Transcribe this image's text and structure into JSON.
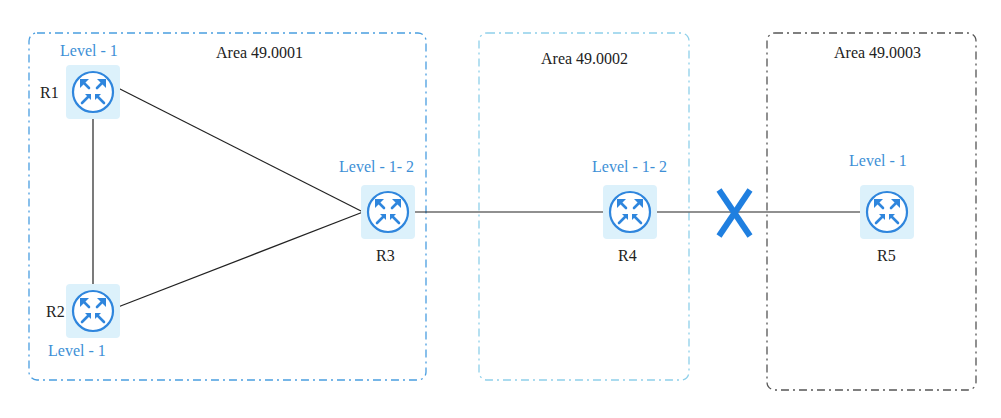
{
  "areas": [
    {
      "id": "area1",
      "label": "Area 49.0001",
      "color": "#4a9ee0"
    },
    {
      "id": "area2",
      "label": "Area 49.0002",
      "color": "#8fd0ea"
    },
    {
      "id": "area3",
      "label": "Area 49.0003",
      "color": "#555555"
    }
  ],
  "routers": [
    {
      "id": "R1",
      "name": "R1",
      "level": "Level - 1"
    },
    {
      "id": "R2",
      "name": "R2",
      "level": "Level - 1"
    },
    {
      "id": "R3",
      "name": "R3",
      "level": "Level - 1- 2"
    },
    {
      "id": "R4",
      "name": "R4",
      "level": "Level - 1- 2"
    },
    {
      "id": "R5",
      "name": "R5",
      "level": "Level - 1"
    }
  ],
  "links": [
    {
      "from": "R1",
      "to": "R2"
    },
    {
      "from": "R1",
      "to": "R3"
    },
    {
      "from": "R2",
      "to": "R3"
    },
    {
      "from": "R3",
      "to": "R4"
    },
    {
      "from": "R4",
      "to": "R5",
      "status": "broken"
    }
  ],
  "colors": {
    "accent": "#2f86dd",
    "router_bg": "#dcf1fb",
    "link": "#222222",
    "fault": "#1f7fe0"
  }
}
